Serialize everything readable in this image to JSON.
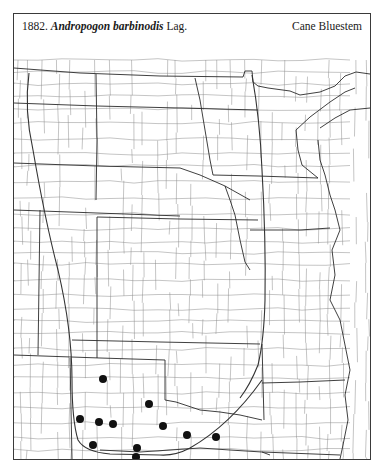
{
  "header": {
    "number": "1882.",
    "genus_species": "Andropogon barbinodis",
    "authority": "Lag.",
    "common_name": "Cane Bluestem"
  },
  "map": {
    "region": "Great Plains (Dakotas to Oklahoma) with adjacent states",
    "colors": {
      "lines": "#555555",
      "state_lines": "#2a2a2a",
      "range_line": "#333333",
      "dot": "#111111"
    },
    "range_lines": [
      "western range limit",
      "eastern range limit"
    ],
    "occurrences": [
      {
        "x": 103,
        "y": 379
      },
      {
        "x": 149,
        "y": 404
      },
      {
        "x": 80,
        "y": 419
      },
      {
        "x": 99,
        "y": 422
      },
      {
        "x": 113,
        "y": 424
      },
      {
        "x": 163,
        "y": 426
      },
      {
        "x": 187,
        "y": 435
      },
      {
        "x": 216,
        "y": 437
      },
      {
        "x": 93,
        "y": 445
      },
      {
        "x": 137,
        "y": 448
      },
      {
        "x": 136,
        "y": 457
      }
    ]
  }
}
